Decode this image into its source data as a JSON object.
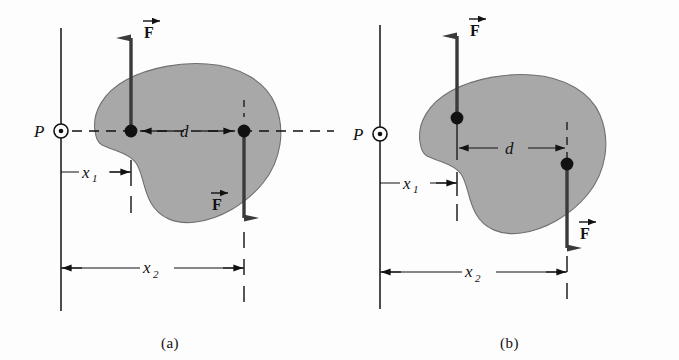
{
  "figure": {
    "title": "",
    "kind": "physics-free-body-diagram",
    "background_color": "#fdfdfd",
    "line_color": "#111111",
    "body_fill_color": "#a8a8a8",
    "body_stroke_color": "#555555",
    "arrow_color": "#3a3a3a",
    "dot_color": "#111111"
  },
  "panels": [
    {
      "id": "a",
      "caption": "(a)",
      "pivot": {
        "label": "P",
        "icon": "dot-in-circle-icon",
        "note": "axis out of page"
      },
      "dimensions": [
        {
          "name": "d",
          "label": "d"
        },
        {
          "name": "x1",
          "label": "x",
          "subscript": "1"
        },
        {
          "name": "x2",
          "label": "x",
          "subscript": "2"
        }
      ],
      "forces": [
        {
          "name": "force-up",
          "label": "F",
          "direction": "up",
          "vector_accent": true
        },
        {
          "name": "force-down",
          "label": "F",
          "direction": "down",
          "vector_accent": true
        }
      ],
      "has_dashed_axis_through_pivot": true,
      "application_points": 2
    },
    {
      "id": "b",
      "caption": "(b)",
      "pivot": {
        "label": "P",
        "icon": "dot-in-circle-icon",
        "note": "axis out of page"
      },
      "dimensions": [
        {
          "name": "d",
          "label": "d"
        },
        {
          "name": "x1",
          "label": "x",
          "subscript": "1"
        },
        {
          "name": "x2",
          "label": "x",
          "subscript": "2"
        }
      ],
      "forces": [
        {
          "name": "force-up",
          "label": "F",
          "direction": "up",
          "vector_accent": true
        },
        {
          "name": "force-down",
          "label": "F",
          "direction": "down",
          "vector_accent": true
        }
      ],
      "has_dashed_axis_through_pivot": false,
      "application_points": 2
    }
  ]
}
